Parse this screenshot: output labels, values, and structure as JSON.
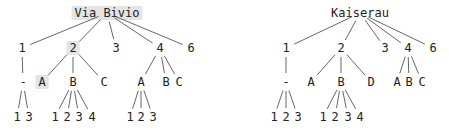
{
  "colors": {
    "text": "#222222",
    "edge": "#555555",
    "highlight": "#e4e4e4",
    "background": "#ffffff"
  },
  "trees": [
    {
      "name": "left-tree",
      "root": {
        "label": "Via Bivio",
        "x": 107,
        "y": 13,
        "highlighted": true
      },
      "nodes": [
        {
          "id": "l1",
          "label": "1",
          "x": 22,
          "y": 48,
          "parent": "root"
        },
        {
          "id": "l2",
          "label": "2",
          "x": 73,
          "y": 48,
          "parent": "root",
          "highlighted": true
        },
        {
          "id": "l3",
          "label": "3",
          "x": 116,
          "y": 48,
          "parent": "root"
        },
        {
          "id": "l4",
          "label": "4",
          "x": 160,
          "y": 48,
          "parent": "root"
        },
        {
          "id": "l6",
          "label": "6",
          "x": 191,
          "y": 48,
          "parent": "root"
        },
        {
          "id": "l1a",
          "label": "-",
          "x": 23,
          "y": 82,
          "parent": "l1"
        },
        {
          "id": "l2a",
          "label": "A",
          "x": 42,
          "y": 82,
          "parent": "l2",
          "highlighted": true
        },
        {
          "id": "l2b",
          "label": "B",
          "x": 73,
          "y": 82,
          "parent": "l2"
        },
        {
          "id": "l2c",
          "label": "C",
          "x": 104,
          "y": 82,
          "parent": "l2"
        },
        {
          "id": "l4a",
          "label": "A",
          "x": 141,
          "y": 82,
          "parent": "l4"
        },
        {
          "id": "l4b",
          "label": "B",
          "x": 166,
          "y": 82,
          "parent": "l4"
        },
        {
          "id": "l4c",
          "label": "C",
          "x": 179,
          "y": 82,
          "parent": "l4"
        },
        {
          "id": "l1a1",
          "label": "1",
          "x": 17,
          "y": 117,
          "parent": "l1a"
        },
        {
          "id": "l1a3",
          "label": "3",
          "x": 29,
          "y": 117,
          "parent": "l1a"
        },
        {
          "id": "l2b1",
          "label": "1",
          "x": 55,
          "y": 117,
          "parent": "l2b"
        },
        {
          "id": "l2b2",
          "label": "2",
          "x": 67,
          "y": 117,
          "parent": "l2b"
        },
        {
          "id": "l2b3",
          "label": "3",
          "x": 79,
          "y": 117,
          "parent": "l2b"
        },
        {
          "id": "l2b4",
          "label": "4",
          "x": 92,
          "y": 117,
          "parent": "l2b"
        },
        {
          "id": "l4a1",
          "label": "1",
          "x": 130,
          "y": 117,
          "parent": "l4a"
        },
        {
          "id": "l4a2",
          "label": "2",
          "x": 141,
          "y": 117,
          "parent": "l4a"
        },
        {
          "id": "l4a3",
          "label": "3",
          "x": 153,
          "y": 117,
          "parent": "l4a"
        }
      ]
    },
    {
      "name": "right-tree",
      "root": {
        "label": "Kaiserau",
        "x": 360,
        "y": 13,
        "highlighted": false
      },
      "nodes": [
        {
          "id": "r1",
          "label": "1",
          "x": 286,
          "y": 48,
          "parent": "root"
        },
        {
          "id": "r2",
          "label": "2",
          "x": 341,
          "y": 48,
          "parent": "root"
        },
        {
          "id": "r3",
          "label": "3",
          "x": 385,
          "y": 48,
          "parent": "root"
        },
        {
          "id": "r4",
          "label": "4",
          "x": 408,
          "y": 48,
          "parent": "root"
        },
        {
          "id": "r6",
          "label": "6",
          "x": 433,
          "y": 48,
          "parent": "root"
        },
        {
          "id": "r1a",
          "label": "-",
          "x": 286,
          "y": 82,
          "parent": "r1"
        },
        {
          "id": "r2a",
          "label": "A",
          "x": 311,
          "y": 82,
          "parent": "r2"
        },
        {
          "id": "r2b",
          "label": "B",
          "x": 341,
          "y": 82,
          "parent": "r2"
        },
        {
          "id": "r2d",
          "label": "D",
          "x": 371,
          "y": 82,
          "parent": "r2"
        },
        {
          "id": "r4a",
          "label": "A",
          "x": 397,
          "y": 82,
          "parent": "r4"
        },
        {
          "id": "r4b",
          "label": "B",
          "x": 409,
          "y": 82,
          "parent": "r4"
        },
        {
          "id": "r4c",
          "label": "C",
          "x": 422,
          "y": 82,
          "parent": "r4"
        },
        {
          "id": "r1a1",
          "label": "1",
          "x": 274,
          "y": 117,
          "parent": "r1a"
        },
        {
          "id": "r1a2",
          "label": "2",
          "x": 286,
          "y": 117,
          "parent": "r1a"
        },
        {
          "id": "r1a3",
          "label": "3",
          "x": 298,
          "y": 117,
          "parent": "r1a"
        },
        {
          "id": "r2b1",
          "label": "1",
          "x": 323,
          "y": 117,
          "parent": "r2b"
        },
        {
          "id": "r2b2",
          "label": "2",
          "x": 335,
          "y": 117,
          "parent": "r2b"
        },
        {
          "id": "r2b3",
          "label": "3",
          "x": 348,
          "y": 117,
          "parent": "r2b"
        },
        {
          "id": "r2b4",
          "label": "4",
          "x": 360,
          "y": 117,
          "parent": "r2b"
        }
      ]
    }
  ]
}
